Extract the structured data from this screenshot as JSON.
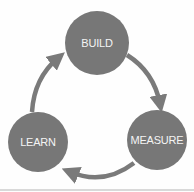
{
  "diagram": {
    "type": "cycle",
    "colors": {
      "node_fill": "#777777",
      "arrow": "#7a7a7a",
      "label_text": "#f4f4f4",
      "background": "#fefefe"
    },
    "nodes": [
      {
        "id": "build",
        "label": "BUILD",
        "cx": 97,
        "cy": 43,
        "r": 32,
        "font_size": 11
      },
      {
        "id": "measure",
        "label": "MEASURE",
        "cx": 157,
        "cy": 140,
        "r": 30,
        "font_size": 11
      },
      {
        "id": "learn",
        "label": "LEARN",
        "cx": 38,
        "cy": 142,
        "r": 30,
        "font_size": 11
      }
    ],
    "edges": [
      {
        "from": "BUILD",
        "to": "MEASURE"
      },
      {
        "from": "MEASURE",
        "to": "LEARN"
      },
      {
        "from": "LEARN",
        "to": "BUILD"
      }
    ]
  }
}
